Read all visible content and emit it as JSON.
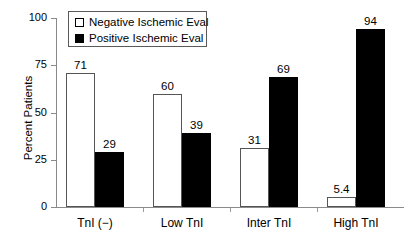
{
  "chart_data": {
    "type": "bar",
    "title": "",
    "xlabel": "",
    "ylabel": "Percent Patients",
    "ylim": [
      0,
      100
    ],
    "yticks": [
      0,
      25,
      50,
      75,
      100
    ],
    "ytick_labels": [
      "0",
      "25",
      "50",
      "75",
      "100"
    ],
    "grid": false,
    "legend_position": "top-left-inside",
    "categories": [
      "TnI (−)",
      "Low TnI",
      "Inter TnI",
      "High TnI"
    ],
    "series": [
      {
        "name": "Negative Ischemic Eval",
        "style": "open",
        "values": [
          71,
          60,
          31,
          5.4
        ],
        "value_labels": [
          "71",
          "60",
          "31",
          "5.4"
        ]
      },
      {
        "name": "Positive Ischemic Eval",
        "style": "filled",
        "values": [
          29,
          39,
          69,
          94
        ],
        "value_labels": [
          "29",
          "39",
          "69",
          "94"
        ]
      }
    ]
  },
  "legend": {
    "items": [
      {
        "label": "Negative Ischemic Eval",
        "style": "open"
      },
      {
        "label": "Positive Ischemic Eval",
        "style": "filled"
      }
    ]
  },
  "colors": {
    "open_fill": "#ffffff",
    "open_edge": "#555555",
    "filled_fill": "#000000",
    "axis": "#8a8a8a",
    "text": "#000000",
    "background": "#ffffff"
  }
}
